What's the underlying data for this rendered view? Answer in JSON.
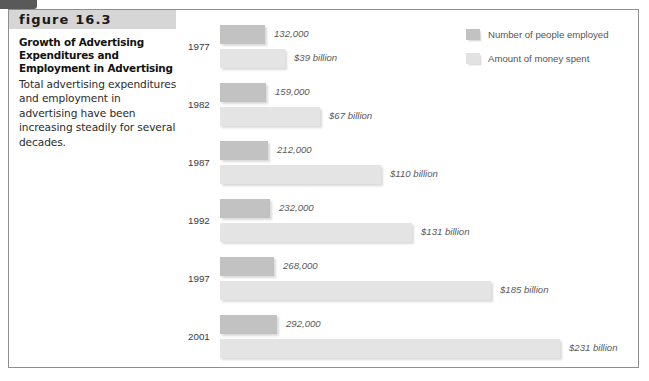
{
  "figure": {
    "tab_icon": "corner-tab",
    "label": "figure 16.3",
    "title": "Growth of Advertising Expenditures and Employment in Advertising",
    "description": "Total advertising expenditures and employment in advertising have been increasing steadily for several decades."
  },
  "legend": {
    "items": [
      {
        "label": "Number of people employed",
        "color": "#c2c2c2",
        "icon": "legend-swatch"
      },
      {
        "label": "Amount of money spent",
        "color": "#e2e2e2",
        "icon": "legend-swatch"
      }
    ]
  },
  "chart_data": {
    "type": "bar",
    "title": "Growth of Advertising Expenditures and Employment in Advertising",
    "xlabel": "",
    "ylabel": "",
    "orientation": "horizontal",
    "grid": false,
    "legend_position": "top-right",
    "categories": [
      "1977",
      "1982",
      "1987",
      "1992",
      "1997",
      "2001"
    ],
    "series": [
      {
        "name": "Number of people employed",
        "color": "#c2c2c2",
        "unit": "people",
        "values": [
          132000,
          159000,
          212000,
          232000,
          268000,
          292000
        ],
        "labels": [
          "132,000",
          "159,000",
          "212,000",
          "232,000",
          "268,000",
          "292,000"
        ]
      },
      {
        "name": "Amount of money spent",
        "color": "#e4e4e4",
        "unit": "billion USD",
        "values": [
          39,
          67,
          110,
          131,
          185,
          231
        ],
        "labels": [
          "$39 billion",
          "$67 billion",
          "$110 billion",
          "$131 billion",
          "$185 billion",
          "$231 billion"
        ]
      }
    ]
  },
  "groups": [
    {
      "year": "1977",
      "people_label": "132,000",
      "money_label": "$39 billion",
      "people_w": 45,
      "money_w": 65,
      "top": 22
    },
    {
      "year": "1982",
      "people_label": "159,000",
      "money_label": "$67 billion",
      "people_w": 46,
      "money_w": 100,
      "top": 80
    },
    {
      "year": "1987",
      "people_label": "212,000",
      "money_label": "$110 billion",
      "people_w": 48,
      "money_w": 161,
      "top": 138
    },
    {
      "year": "1992",
      "people_label": "232,000",
      "money_label": "$131 billion",
      "people_w": 50,
      "money_w": 192,
      "top": 196
    },
    {
      "year": "1997",
      "people_label": "268,000",
      "money_label": "$185 billion",
      "people_w": 54,
      "money_w": 271,
      "top": 254
    },
    {
      "year": "2001",
      "people_label": "292,000",
      "money_label": "$231 billion",
      "people_w": 57,
      "money_w": 340,
      "top": 312
    }
  ]
}
